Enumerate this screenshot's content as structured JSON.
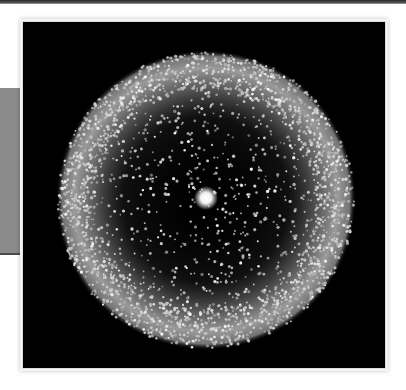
{
  "image": {
    "subject": "glowing particle ring",
    "colors": {
      "background": "#000000",
      "ring": "#c8c8c8",
      "center": "#ffffff",
      "side_panel": "#8a8a8a",
      "page": "#ffffff"
    },
    "ring": {
      "cx": 183,
      "cy": 178,
      "outer_radius": 148,
      "inner_radius": 110
    },
    "center_dot": {
      "cx": 183,
      "cy": 178,
      "radius": 7
    }
  }
}
